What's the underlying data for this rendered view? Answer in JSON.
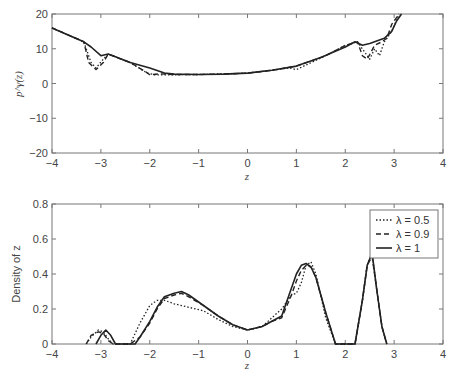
{
  "chart_data": [
    {
      "type": "line",
      "title": "",
      "xlabel": "z",
      "ylabel": "p^γ(z)",
      "xlim": [
        -4,
        4
      ],
      "ylim": [
        -20,
        20
      ],
      "xticks": [
        -4,
        -3,
        -2,
        -1,
        0,
        1,
        2,
        3,
        4
      ],
      "yticks": [
        -20,
        -10,
        0,
        10,
        20
      ],
      "grid": false,
      "series": [
        {
          "name": "λ = 0.5",
          "style": "dotted",
          "x": [
            -4,
            -3.35,
            -3.2,
            -3.1,
            -2.95,
            -2.85,
            -2.4,
            -2.05,
            -1.9,
            -1.5,
            -1,
            -0.5,
            0,
            0.5,
            0.85,
            1.0,
            1.15,
            1.6,
            2.0,
            2.25,
            2.4,
            2.5,
            2.6,
            2.7,
            2.8,
            2.95,
            3.1
          ],
          "y": [
            16,
            12,
            6,
            4.5,
            7,
            8.5,
            6,
            3,
            2.5,
            2.5,
            2.6,
            2.7,
            3,
            3.8,
            4.5,
            4,
            5,
            8,
            11,
            12,
            9,
            7,
            10,
            8,
            12,
            15,
            20
          ]
        },
        {
          "name": "λ = 0.9",
          "style": "dashed",
          "x": [
            -4,
            -3.35,
            -3.25,
            -3.1,
            -2.95,
            -2.85,
            -2.4,
            -2.1,
            -2.0,
            -1.8,
            -1.5,
            -1,
            -0.5,
            0,
            0.5,
            1.0,
            1.6,
            2.0,
            2.25,
            2.35,
            2.45,
            2.6,
            2.75,
            2.85,
            2.95,
            3.1
          ],
          "y": [
            16,
            12,
            6,
            4,
            6,
            8.5,
            6,
            3.5,
            2.5,
            2.8,
            2.6,
            2.6,
            2.7,
            3,
            3.8,
            5,
            8,
            11,
            12,
            8,
            7,
            11,
            12,
            13,
            17,
            20
          ]
        },
        {
          "name": "λ = 1",
          "style": "solid",
          "x": [
            -4,
            -3.35,
            -3.2,
            -3.0,
            -2.85,
            -2.4,
            -2.0,
            -1.7,
            -1.5,
            -1,
            -0.5,
            0,
            0.5,
            1.0,
            1.5,
            2.0,
            2.2,
            2.35,
            2.5,
            2.8,
            2.95,
            3.05,
            3.15
          ],
          "y": [
            16,
            12,
            10.5,
            8,
            8.5,
            6,
            4.5,
            3,
            2.7,
            2.6,
            2.7,
            3,
            3.8,
            5,
            7.5,
            10.5,
            12,
            11,
            11.5,
            13,
            15,
            18,
            20
          ]
        }
      ]
    },
    {
      "type": "line",
      "title": "",
      "xlabel": "z",
      "ylabel": "Density of z",
      "xlim": [
        -4,
        4
      ],
      "ylim": [
        0,
        0.8
      ],
      "xticks": [
        -4,
        -3,
        -2,
        -1,
        0,
        1,
        2,
        3,
        4
      ],
      "yticks": [
        0,
        0.2,
        0.4,
        0.6,
        0.8
      ],
      "grid": false,
      "legend_position": "upper right",
      "series": [
        {
          "name": "λ = 0.5",
          "style": "dotted",
          "x": [
            -3.3,
            -3.2,
            -3.05,
            -2.95,
            -2.85,
            -2.75,
            -2.4,
            -2.2,
            -2.0,
            -1.85,
            -1.7,
            -1.5,
            -1.2,
            -0.9,
            -0.6,
            -0.3,
            0,
            0.3,
            0.5,
            0.7,
            0.9,
            1.0,
            1.1,
            1.2,
            1.3,
            1.4,
            1.6,
            1.8,
            2.2,
            2.35,
            2.45,
            2.55,
            2.65,
            2.75,
            2.85
          ],
          "y": [
            0,
            0.04,
            0.08,
            0.07,
            0.03,
            0,
            0,
            0.12,
            0.22,
            0.25,
            0.25,
            0.23,
            0.21,
            0.19,
            0.14,
            0.1,
            0.08,
            0.1,
            0.15,
            0.2,
            0.28,
            0.29,
            0.35,
            0.45,
            0.47,
            0.4,
            0.15,
            0,
            0,
            0.25,
            0.45,
            0.52,
            0.3,
            0.1,
            0
          ]
        },
        {
          "name": "λ = 0.9",
          "style": "dashed",
          "x": [
            -3.3,
            -3.2,
            -3.05,
            -2.95,
            -2.85,
            -2.75,
            -2.4,
            -2.2,
            -2.0,
            -1.85,
            -1.7,
            -1.5,
            -1.35,
            -1.2,
            -0.9,
            -0.6,
            -0.3,
            0,
            0.3,
            0.5,
            0.7,
            0.9,
            1.0,
            1.1,
            1.2,
            1.3,
            1.4,
            1.6,
            1.8,
            2.2,
            2.35,
            2.45,
            2.55,
            2.65,
            2.75,
            2.85
          ],
          "y": [
            0,
            0.05,
            0.07,
            0.06,
            0.02,
            0,
            0,
            0.04,
            0.12,
            0.2,
            0.26,
            0.28,
            0.29,
            0.27,
            0.22,
            0.16,
            0.11,
            0.08,
            0.1,
            0.13,
            0.15,
            0.28,
            0.36,
            0.42,
            0.45,
            0.44,
            0.38,
            0.18,
            0,
            0,
            0.25,
            0.45,
            0.5,
            0.3,
            0.1,
            0
          ]
        },
        {
          "name": "λ = 1",
          "style": "solid",
          "x": [
            -3.1,
            -3.0,
            -2.9,
            -2.8,
            -2.7,
            -2.3,
            -2.2,
            -2.0,
            -1.85,
            -1.7,
            -1.5,
            -1.35,
            -1.2,
            -0.9,
            -0.6,
            -0.3,
            0,
            0.3,
            0.5,
            0.7,
            0.9,
            1.0,
            1.1,
            1.2,
            1.3,
            1.4,
            1.6,
            1.8,
            2.2,
            2.35,
            2.45,
            2.55,
            2.65,
            2.75,
            2.85
          ],
          "y": [
            0,
            0.05,
            0.08,
            0.05,
            0,
            0,
            0.04,
            0.13,
            0.21,
            0.27,
            0.29,
            0.3,
            0.28,
            0.22,
            0.16,
            0.11,
            0.08,
            0.1,
            0.13,
            0.16,
            0.32,
            0.4,
            0.45,
            0.46,
            0.44,
            0.38,
            0.18,
            0,
            0,
            0.25,
            0.45,
            0.52,
            0.3,
            0.1,
            0
          ]
        }
      ]
    }
  ],
  "legend": {
    "items": [
      {
        "label": "λ = 0.5",
        "style": "dotted"
      },
      {
        "label": "λ = 0.9",
        "style": "dashed"
      },
      {
        "label": "λ = 1",
        "style": "solid"
      }
    ]
  },
  "top_plot": {
    "ylabel": "p^γ(z)",
    "xlabel": "z",
    "xtick_labels": [
      "−4",
      "−3",
      "−2",
      "−1",
      "0",
      "1",
      "2",
      "3",
      "4"
    ],
    "ytick_labels": [
      "20",
      "10",
      "0",
      "−10",
      "−20"
    ]
  },
  "bottom_plot": {
    "ylabel": "Density of z",
    "xlabel": "z",
    "xtick_labels": [
      "−4",
      "−3",
      "−2",
      "−1",
      "0",
      "1",
      "2",
      "3",
      "4"
    ],
    "ytick_labels": [
      "0.8",
      "0.6",
      "0.4",
      "0.2",
      "0"
    ]
  },
  "colors": {
    "line": "#222222",
    "axis": "#666666",
    "text": "#444444"
  }
}
